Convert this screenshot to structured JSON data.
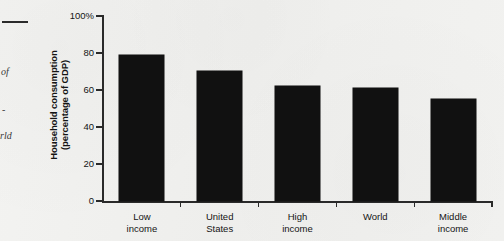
{
  "page": {
    "background_color": "#f1f1ef",
    "margin_artifacts": [
      {
        "type": "rule",
        "name": "margin-rule"
      },
      {
        "type": "text",
        "name": "margin-fragment-of",
        "text": "of"
      },
      {
        "type": "text",
        "name": "margin-fragment-dash",
        "text": "-"
      },
      {
        "type": "text",
        "name": "margin-fragment-rld",
        "text": "rld"
      }
    ]
  },
  "chart_data": {
    "type": "bar",
    "title": "",
    "xlabel": "",
    "ylabel": "Household consumption (percentage of GDP)",
    "ylabel_lines": [
      "Household consumption",
      "(percentage of GDP)"
    ],
    "categories": [
      "Low income",
      "United States",
      "High income",
      "World",
      "Middle income"
    ],
    "category_lines": [
      [
        "Low",
        "income"
      ],
      [
        "United",
        "States"
      ],
      [
        "High",
        "income"
      ],
      [
        "World",
        ""
      ],
      [
        "Middle",
        "income"
      ]
    ],
    "values": [
      79,
      70.5,
      62,
      61,
      55
    ],
    "ylim": [
      0,
      100
    ],
    "yticks": [
      0,
      20,
      40,
      60,
      80,
      100
    ],
    "ytick_labels": [
      "0",
      "20",
      "40",
      "60",
      "80",
      "100%"
    ],
    "grid": false,
    "legend": false,
    "bar_color": "#111111",
    "axis_color": "#2a2a2a"
  }
}
